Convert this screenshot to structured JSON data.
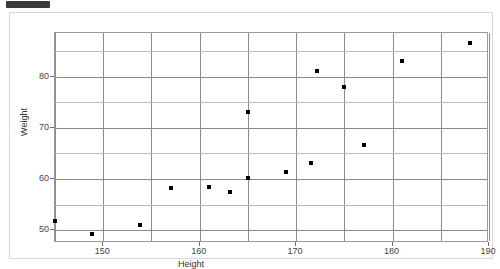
{
  "window": {
    "top_nub": "toolbar-nub"
  },
  "chart_data": {
    "type": "scatter",
    "title": "",
    "xlabel": "Height",
    "ylabel": "Weight",
    "xlim": [
      145,
      190
    ],
    "ylim": [
      47.5,
      88.5
    ],
    "xticks": [
      150,
      160,
      170,
      180,
      190
    ],
    "xtick_labels": [
      "150",
      "160",
      "170",
      "180",
      "190"
    ],
    "yticks": [
      50,
      60,
      70,
      80
    ],
    "ytick_labels": [
      "50",
      "60",
      "70",
      "80"
    ],
    "grid": true,
    "grid_minor_y": [
      55,
      65,
      75,
      85
    ],
    "grid_major_x": [
      145,
      150,
      155,
      160,
      165,
      170,
      175,
      180,
      185,
      190
    ],
    "legend": null,
    "marker": "square",
    "marker_color": "#000000",
    "points": [
      {
        "x": 145.0,
        "y": 51.8
      },
      {
        "x": 148.8,
        "y": 49.2
      },
      {
        "x": 153.8,
        "y": 51.0
      },
      {
        "x": 157.0,
        "y": 58.2
      },
      {
        "x": 161.0,
        "y": 58.4
      },
      {
        "x": 163.1,
        "y": 57.4
      },
      {
        "x": 165.0,
        "y": 73.0
      },
      {
        "x": 165.0,
        "y": 60.2
      },
      {
        "x": 168.9,
        "y": 61.3
      },
      {
        "x": 171.5,
        "y": 63.1
      },
      {
        "x": 172.2,
        "y": 81.0
      },
      {
        "x": 175.0,
        "y": 78.0
      },
      {
        "x": 177.0,
        "y": 66.7
      },
      {
        "x": 181.0,
        "y": 83.0
      },
      {
        "x": 188.0,
        "y": 86.5
      }
    ]
  }
}
